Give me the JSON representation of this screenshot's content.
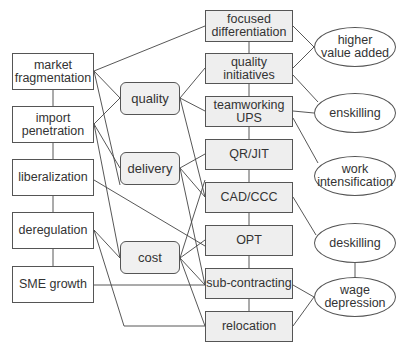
{
  "diagram": {
    "line_color": "#444444",
    "drivers": [
      {
        "id": "mf",
        "label": "market\nfragmentation",
        "x": 12,
        "y": 53,
        "w": 82,
        "h": 37
      },
      {
        "id": "ip",
        "label": "import\npenetration",
        "x": 12,
        "y": 106,
        "w": 82,
        "h": 37
      },
      {
        "id": "lib",
        "label": "liberalization",
        "x": 12,
        "y": 159,
        "w": 82,
        "h": 37
      },
      {
        "id": "dereg",
        "label": "deregulation",
        "x": 12,
        "y": 212,
        "w": 82,
        "h": 37
      },
      {
        "id": "sme",
        "label": "SME growth",
        "x": 12,
        "y": 266,
        "w": 82,
        "h": 37
      }
    ],
    "strategies": [
      {
        "id": "q",
        "label": "quality",
        "x": 120,
        "y": 82,
        "w": 60,
        "h": 33
      },
      {
        "id": "d",
        "label": "delivery",
        "x": 120,
        "y": 152,
        "w": 60,
        "h": 33
      },
      {
        "id": "c",
        "label": "cost",
        "x": 120,
        "y": 241,
        "w": 60,
        "h": 33
      }
    ],
    "practices": [
      {
        "id": "fd",
        "label": "focused\ndifferentiation",
        "x": 205,
        "y": 10,
        "w": 88,
        "h": 32
      },
      {
        "id": "qi",
        "label": "quality\ninitiatives",
        "x": 205,
        "y": 53,
        "w": 88,
        "h": 31
      },
      {
        "id": "tw",
        "label": "teamworking\nUPS",
        "x": 205,
        "y": 96,
        "w": 88,
        "h": 31
      },
      {
        "id": "qr",
        "label": "QR/JIT",
        "x": 205,
        "y": 139,
        "w": 88,
        "h": 31
      },
      {
        "id": "cad",
        "label": "CAD/CCC",
        "x": 205,
        "y": 182,
        "w": 88,
        "h": 31
      },
      {
        "id": "opt",
        "label": "OPT",
        "x": 205,
        "y": 225,
        "w": 88,
        "h": 31
      },
      {
        "id": "sub",
        "label": "sub-contracting",
        "x": 205,
        "y": 268,
        "w": 88,
        "h": 31
      },
      {
        "id": "rel",
        "label": "relocation",
        "x": 205,
        "y": 311,
        "w": 88,
        "h": 31
      }
    ],
    "outcomes": [
      {
        "id": "hva",
        "label": "higher\nvalue added",
        "x": 314,
        "y": 27,
        "w": 82,
        "h": 40
      },
      {
        "id": "ensk",
        "label": "enskilling",
        "x": 314,
        "y": 93,
        "w": 82,
        "h": 40
      },
      {
        "id": "wi",
        "label": "work\nintensification",
        "x": 314,
        "y": 156,
        "w": 82,
        "h": 40
      },
      {
        "id": "desk",
        "label": "deskilling",
        "x": 314,
        "y": 223,
        "w": 82,
        "h": 40
      },
      {
        "id": "wd",
        "label": "wage\ndepression",
        "x": 314,
        "y": 277,
        "w": 82,
        "h": 40
      }
    ],
    "edges": [
      {
        "path": [
          [
            94,
            71
          ],
          [
            205,
            26
          ]
        ]
      },
      {
        "path": [
          [
            94,
            71
          ],
          [
            120,
            98
          ]
        ]
      },
      {
        "path": [
          [
            94,
            71
          ],
          [
            120,
            185
          ]
        ]
      },
      {
        "path": [
          [
            94,
            124
          ],
          [
            120,
            98
          ]
        ]
      },
      {
        "path": [
          [
            94,
            124
          ],
          [
            120,
            168
          ]
        ]
      },
      {
        "path": [
          [
            94,
            124
          ],
          [
            120,
            258
          ]
        ]
      },
      {
        "path": [
          [
            94,
            180
          ],
          [
            205,
            246
          ]
        ]
      },
      {
        "path": [
          [
            94,
            230
          ],
          [
            120,
            258
          ]
        ]
      },
      {
        "path": [
          [
            94,
            230
          ],
          [
            124,
            326
          ],
          [
            205,
            326
          ]
        ]
      },
      {
        "path": [
          [
            94,
            285
          ],
          [
            205,
            285
          ]
        ]
      },
      {
        "path": [
          [
            180,
            98
          ],
          [
            205,
            68
          ]
        ]
      },
      {
        "path": [
          [
            180,
            98
          ],
          [
            205,
            111
          ]
        ]
      },
      {
        "path": [
          [
            180,
            98
          ],
          [
            205,
            197
          ]
        ]
      },
      {
        "path": [
          [
            180,
            168
          ],
          [
            205,
            154
          ]
        ]
      },
      {
        "path": [
          [
            180,
            168
          ],
          [
            205,
            197
          ]
        ]
      },
      {
        "path": [
          [
            180,
            168
          ],
          [
            205,
            285
          ]
        ]
      },
      {
        "path": [
          [
            180,
            258
          ],
          [
            205,
            180
          ]
        ]
      },
      {
        "path": [
          [
            180,
            258
          ],
          [
            205,
            240
          ]
        ]
      },
      {
        "path": [
          [
            180,
            258
          ],
          [
            205,
            285
          ]
        ]
      },
      {
        "path": [
          [
            180,
            258
          ],
          [
            205,
            326
          ]
        ]
      },
      {
        "path": [
          [
            53,
            90
          ],
          [
            53,
            106
          ]
        ]
      },
      {
        "path": [
          [
            53,
            143
          ],
          [
            53,
            159
          ]
        ]
      },
      {
        "path": [
          [
            53,
            196
          ],
          [
            53,
            212
          ]
        ]
      },
      {
        "path": [
          [
            53,
            249
          ],
          [
            53,
            266
          ]
        ]
      },
      {
        "path": [
          [
            249,
            42
          ],
          [
            249,
            53
          ]
        ]
      },
      {
        "path": [
          [
            249,
            84
          ],
          [
            249,
            96
          ]
        ]
      },
      {
        "path": [
          [
            249,
            127
          ],
          [
            249,
            139
          ]
        ]
      },
      {
        "path": [
          [
            249,
            170
          ],
          [
            249,
            182
          ]
        ]
      },
      {
        "path": [
          [
            249,
            213
          ],
          [
            249,
            225
          ]
        ]
      },
      {
        "path": [
          [
            249,
            256
          ],
          [
            249,
            268
          ]
        ]
      },
      {
        "path": [
          [
            249,
            299
          ],
          [
            249,
            311
          ]
        ]
      },
      {
        "path": [
          [
            293,
            26
          ],
          [
            314,
            47
          ]
        ]
      },
      {
        "path": [
          [
            293,
            68
          ],
          [
            314,
            47
          ]
        ]
      },
      {
        "path": [
          [
            293,
            75
          ],
          [
            318,
            102
          ]
        ]
      },
      {
        "path": [
          [
            293,
            111
          ],
          [
            314,
            113
          ]
        ]
      },
      {
        "path": [
          [
            293,
            118
          ],
          [
            318,
            163
          ]
        ]
      },
      {
        "path": [
          [
            293,
            197
          ],
          [
            316,
            235
          ]
        ]
      },
      {
        "path": [
          [
            355,
            263
          ],
          [
            355,
            277
          ]
        ]
      },
      {
        "path": [
          [
            293,
            285
          ],
          [
            314,
            297
          ]
        ]
      },
      {
        "path": [
          [
            293,
            326
          ],
          [
            314,
            297
          ]
        ]
      }
    ]
  }
}
